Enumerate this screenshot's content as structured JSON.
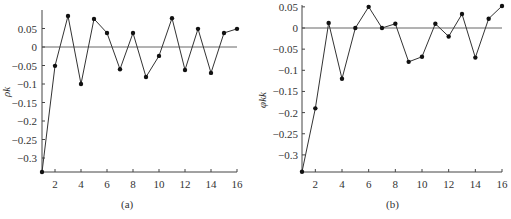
{
  "chart_data": [
    {
      "type": "line",
      "panel": "(a)",
      "ylabel": "ρk",
      "xlabel": "",
      "caption": "(a)",
      "x": [
        1,
        2,
        3,
        4,
        5,
        6,
        7,
        8,
        9,
        10,
        11,
        12,
        13,
        14,
        15,
        16
      ],
      "values": [
        -0.338,
        -0.051,
        0.084,
        -0.1,
        0.076,
        0.038,
        -0.06,
        0.038,
        -0.081,
        -0.024,
        0.078,
        -0.062,
        0.049,
        -0.07,
        0.038,
        0.049
      ],
      "xticks": [
        "2",
        "4",
        "6",
        "8",
        "10",
        "12",
        "14",
        "16"
      ],
      "yticks": [
        "0.05",
        "0",
        "-0.05",
        "-0.1",
        "-0.15",
        "-0.2",
        "-0.25",
        "-0.3"
      ],
      "ylim": [
        -0.34,
        0.09
      ],
      "xlim": [
        1,
        16
      ],
      "zero_line": true,
      "grid": false
    },
    {
      "type": "line",
      "panel": "(b)",
      "ylabel": "φkk",
      "xlabel": "",
      "caption": "(b)",
      "x": [
        1,
        2,
        3,
        4,
        5,
        6,
        7,
        8,
        9,
        10,
        11,
        12,
        13,
        14,
        15,
        16
      ],
      "values": [
        -0.34,
        -0.19,
        0.012,
        -0.12,
        0.0,
        0.05,
        0.0,
        0.01,
        -0.08,
        -0.068,
        0.01,
        -0.02,
        0.033,
        -0.07,
        0.022,
        0.052
      ],
      "xticks": [
        "2",
        "4",
        "6",
        "8",
        "10",
        "12",
        "14",
        "16"
      ],
      "yticks": [
        "0.05",
        "0",
        "-0.05",
        "-0.1",
        "-0.15",
        "-0.2",
        "-0.25",
        "-0.3"
      ],
      "ylim": [
        -0.34,
        0.05
      ],
      "xlim": [
        1,
        16
      ],
      "zero_line": true,
      "grid": false
    }
  ],
  "captions": {
    "a": "(a)",
    "b": "(b)"
  },
  "ylabels": {
    "a": "ρk",
    "b": "φkk"
  }
}
